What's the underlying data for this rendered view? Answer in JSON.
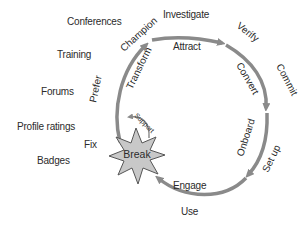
{
  "diagram": {
    "type": "cycle",
    "center_node": {
      "label": "Break",
      "shape": "star",
      "fill": "#c8c8c8"
    },
    "stages": [
      {
        "inner": "Attract",
        "outer": "Investigate"
      },
      {
        "inner": "Convert",
        "outer": "Verify"
      },
      {
        "inner": "Onboard",
        "outer": "Commit"
      },
      {
        "inner": "Engage",
        "outer": "Set up"
      },
      {
        "inner": "",
        "outer": "Use"
      },
      {
        "inner": "Transform",
        "outer": "Champion"
      }
    ],
    "loop_labels": {
      "support": "Support",
      "fix": "Fix",
      "prefer": "Prefer"
    },
    "side_labels": [
      "Conferences",
      "Training",
      "Forums",
      "Profile ratings",
      "Badges"
    ],
    "colors": {
      "arrow": "#8a8a8a",
      "star_fill": "#c8c8c8",
      "star_stroke": "#555555",
      "text": "#2b2b2b"
    }
  }
}
